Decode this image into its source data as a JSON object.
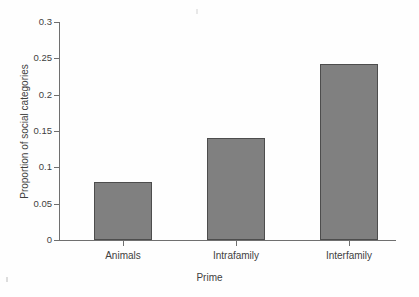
{
  "figure": {
    "background_color": "#fefefe",
    "axis_color": "#6f6f6f",
    "text_color": "#3f3f3f"
  },
  "axes": {
    "x_title": "Prime",
    "y_title": "Proportion of social categories",
    "y_tick_labels": [
      "0.3",
      "0.25",
      "0.2",
      "0.15",
      "0.1",
      "0.05",
      "0"
    ],
    "x_tick_labels": [
      "Animals",
      "Intrafamily",
      "Interfamily"
    ]
  },
  "bars": [
    {
      "label": "Animals",
      "value": "0.08"
    },
    {
      "label": "Intrafamily",
      "value": "0.14"
    },
    {
      "label": "Interfamily",
      "value": "0.242"
    }
  ],
  "chart_data": {
    "type": "bar",
    "title": "",
    "subtitle": "",
    "xlabel": "Prime",
    "ylabel": "Proportion of social categories",
    "categories": [
      "Animals",
      "Intrafamily",
      "Interfamily"
    ],
    "values": [
      0.08,
      0.14,
      0.242
    ],
    "ylim": [
      0,
      0.3
    ],
    "yticks": [
      0,
      0.05,
      0.1,
      0.15,
      0.2,
      0.25,
      0.3
    ],
    "ytick_labels": [
      "0",
      "0.05",
      "0.1",
      "0.15",
      "0.2",
      "0.25",
      "0.3"
    ],
    "grid": false,
    "legend": null,
    "bar_fill_color": "#808080",
    "bar_edge_color": "#4d4d4d",
    "annotations": []
  }
}
